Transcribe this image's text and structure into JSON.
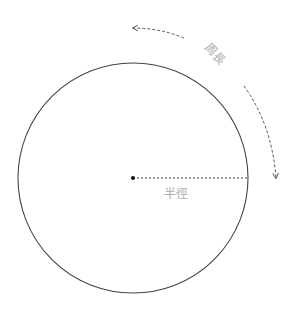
{
  "diagram": {
    "labels": {
      "circumference": "周長",
      "radius": "半徑"
    },
    "colors": {
      "circle": "#444444",
      "radius_line": "#333333",
      "arrows": "#555555",
      "label_text": "#aaaaaa"
    }
  }
}
